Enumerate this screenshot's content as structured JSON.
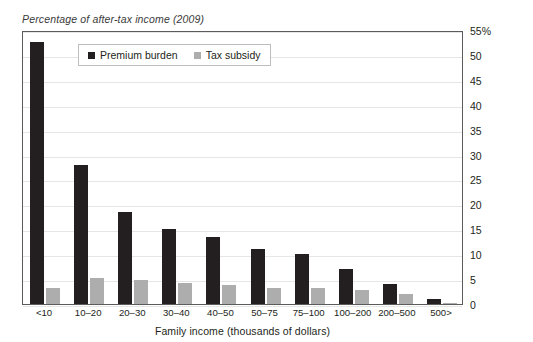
{
  "clipped_header_text": " ",
  "subtitle": "Percentage of after-tax income (2009)",
  "legend": {
    "premium_label": "Premium burden",
    "subsidy_label": "Tax subsidy"
  },
  "axis": {
    "x_title": "Family income (thousands of dollars)",
    "y_ticks": [
      "55%",
      "50",
      "45",
      "40",
      "35",
      "30",
      "25",
      "20",
      "15",
      "10",
      "5",
      "0"
    ]
  },
  "colors": {
    "premium": "#231f20",
    "subsidy": "#adadad",
    "frame": "#5b5b5b",
    "gridline": "#e6e6e6",
    "background": "#ffffff"
  },
  "chart_data": {
    "type": "bar",
    "title": "Percentage of after-tax income (2009)",
    "xlabel": "Family income (thousands of dollars)",
    "ylabel": "",
    "ylim": [
      0,
      55
    ],
    "ytick_step": 5,
    "grid": true,
    "y_axis_position": "right",
    "legend_position": "top-left-inside",
    "categories": [
      "<10",
      "10–20",
      "20–30",
      "30–40",
      "40–50",
      "50–75",
      "75–100",
      "100–200",
      "200–500",
      "500>"
    ],
    "series": [
      {
        "name": "Premium burden",
        "color": "#231f20",
        "values": [
          52.5,
          28.0,
          18.5,
          15.0,
          13.5,
          11.0,
          10.0,
          7.0,
          4.0,
          1.0
        ]
      },
      {
        "name": "Tax subsidy",
        "color": "#adadad",
        "values": [
          3.3,
          5.2,
          4.8,
          4.2,
          3.8,
          3.3,
          3.3,
          2.8,
          2.0,
          0.3
        ]
      }
    ]
  }
}
